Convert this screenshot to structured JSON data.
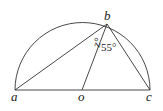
{
  "diagram": {
    "points": {
      "a": {
        "label": "a",
        "x": 15,
        "y": 90
      },
      "o": {
        "label": "o",
        "x": 82,
        "y": 90
      },
      "c": {
        "label": "c",
        "x": 150,
        "y": 90
      },
      "b": {
        "label": "b",
        "x": 107,
        "y": 24
      }
    },
    "angles": {
      "abo": "z°",
      "obc": "55°"
    },
    "stroke_color": "#333333"
  }
}
